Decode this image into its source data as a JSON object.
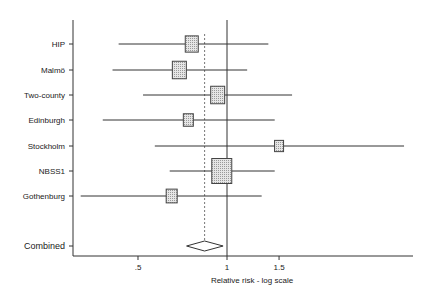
{
  "chart_data": {
    "type": "forest",
    "title": "",
    "xlabel": "Relative risk - log scale",
    "ylabel": "",
    "xscale": "log",
    "x_ticks": [
      {
        "value": 0.5,
        "label": ".5"
      },
      {
        "value": 1,
        "label": "1"
      },
      {
        "value": 1.5,
        "label": "1.5"
      }
    ],
    "reference_line": 1,
    "pooled_line": 0.84,
    "studies": [
      {
        "name": "HIP",
        "rr": 0.76,
        "ci_low": 0.43,
        "ci_high": 1.38,
        "weight_box": 13
      },
      {
        "name": "Malmö",
        "rr": 0.69,
        "ci_low": 0.41,
        "ci_high": 1.17,
        "weight_box": 14
      },
      {
        "name": "Two-county",
        "rr": 0.93,
        "ci_low": 0.52,
        "ci_high": 1.66,
        "weight_box": 14
      },
      {
        "name": "Edinburgh",
        "rr": 0.74,
        "ci_low": 0.38,
        "ci_high": 1.45,
        "weight_box": 10
      },
      {
        "name": "Stockholm",
        "rr": 1.5,
        "ci_low": 0.57,
        "ci_high": 3.97,
        "weight_box": 9
      },
      {
        "name": "NBSS1",
        "rr": 0.96,
        "ci_low": 0.64,
        "ci_high": 1.45,
        "weight_box": 20
      },
      {
        "name": "Gothenburg",
        "rr": 0.65,
        "ci_low": 0.32,
        "ci_high": 1.31,
        "weight_box": 11
      }
    ],
    "combined": {
      "name": "Combined",
      "rr": 0.84,
      "ci_low": 0.73,
      "ci_high": 0.97
    },
    "grid": false,
    "legend": "none"
  }
}
